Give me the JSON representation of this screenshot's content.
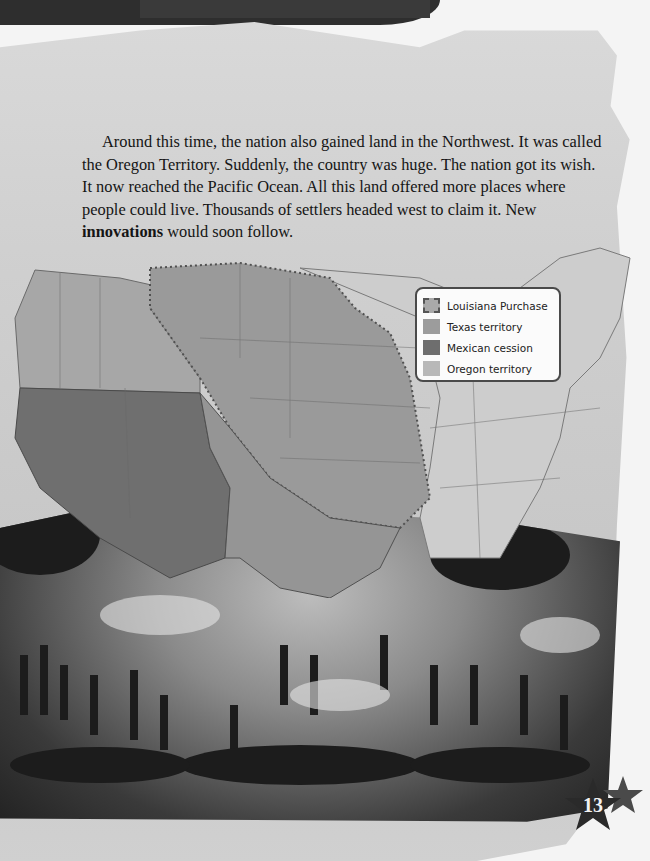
{
  "paragraph": {
    "text_before": "Around this time, the nation also gained land in the Northwest.  It was called the Oregon Territory.  Suddenly, the country was huge.  The nation got its wish.  It now reached the Pacific Ocean.  All this land offered more places where people could live.  Thousands of settlers headed west to claim it.  New ",
    "bold_term": "innovations",
    "text_after": " would soon follow."
  },
  "map": {
    "legend": {
      "items": [
        {
          "label": "Louisiana Purchase",
          "swatch": "#a9a9a9",
          "style": "dashed"
        },
        {
          "label": "Texas territory",
          "swatch": "#9c9c9c",
          "style": "solid"
        },
        {
          "label": "Mexican cession",
          "swatch": "#6e6e6e",
          "style": "solid"
        },
        {
          "label": "Oregon territory",
          "swatch": "#b8b8b8",
          "style": "solid"
        }
      ]
    },
    "colors": {
      "louisiana": "#9a9a9a",
      "texas": "#959595",
      "mexican": "#6f6f6f",
      "oregon": "#a7a7a7",
      "east": "#cdcdcd",
      "border": "#5a5a5a"
    }
  },
  "page_number": "13"
}
